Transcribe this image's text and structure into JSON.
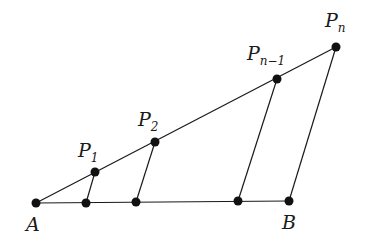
{
  "diagram": {
    "labels": {
      "A": "A",
      "B": "B",
      "P1_base": "P",
      "P1_sub": "1",
      "P2_base": "P",
      "P2_sub": "2",
      "Pn1_base": "P",
      "Pn1_sub": "n−1",
      "Pn_base": "P",
      "Pn_sub": "n"
    },
    "points": {
      "A": [
        36,
        203
      ],
      "B": [
        289,
        201
      ],
      "P1": [
        95,
        172
      ],
      "P2": [
        155,
        142
      ],
      "Pn_minus_1": [
        277,
        79
      ],
      "Pn": [
        336,
        47
      ],
      "Q1": [
        86,
        203
      ],
      "Q2": [
        136,
        202
      ],
      "Qn_minus_1": [
        238,
        201
      ]
    },
    "colors": {
      "stroke": "#1a1a1a",
      "dot": "#111111"
    }
  }
}
